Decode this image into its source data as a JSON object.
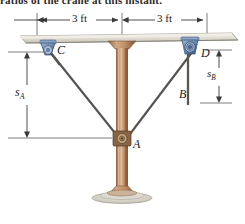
{
  "figure": {
    "caption_fragment": "ratios of the crane at this instant.",
    "dimensions": {
      "left_span": "3 ft",
      "right_span": "3 ft"
    },
    "labels": {
      "pulley_c": "C",
      "pulley_d": "D",
      "pulley_a": "A",
      "block_b": "B",
      "distance_a_symbol": "s",
      "distance_a_sub": "A",
      "distance_b_symbol": "s",
      "distance_b_sub": "B"
    },
    "icons": {
      "left_dim_arrow": "dimension-arrow-icon",
      "right_dim_arrow": "dimension-arrow-icon",
      "vertical_dim_arrow": "dimension-arrow-icon"
    },
    "colors": {
      "slab_fill": "#d8d5cb",
      "slab_edge": "#8e8b80",
      "column_fill": "#b08060",
      "column_dark": "#8a5f44",
      "pulley_blue": "#6f8bb0",
      "pulley_blue_dark": "#3e5a80",
      "cable": "#56524e",
      "dim_line": "#3a3a3a",
      "background": "#ffffff"
    }
  }
}
